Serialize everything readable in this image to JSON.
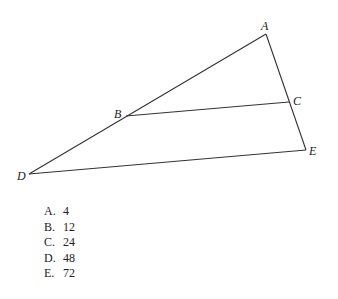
{
  "figure": {
    "points": {
      "A": {
        "label": "A",
        "x": 266,
        "y": 34
      },
      "B": {
        "label": "B",
        "x": 126,
        "y": 116
      },
      "C": {
        "label": "C",
        "x": 289,
        "y": 102
      },
      "D": {
        "label": "D",
        "x": 29,
        "y": 174
      },
      "E": {
        "label": "E",
        "x": 306,
        "y": 150
      }
    },
    "segments": [
      "AD",
      "AE",
      "BC",
      "DE"
    ]
  },
  "choices": [
    {
      "letter": "A.",
      "value": "4"
    },
    {
      "letter": "B.",
      "value": "12"
    },
    {
      "letter": "C.",
      "value": "24"
    },
    {
      "letter": "D.",
      "value": "48"
    },
    {
      "letter": "E.",
      "value": "72"
    }
  ]
}
